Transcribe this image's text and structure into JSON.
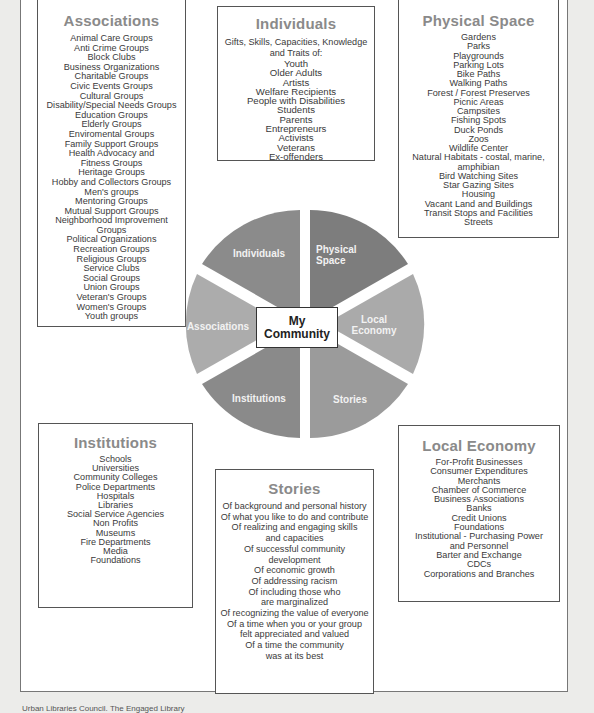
{
  "diagram": {
    "title": "My Community",
    "center_label_line1": "My",
    "center_label_line2": "Community",
    "slices": [
      {
        "id": "individuals",
        "label_line1": "Individuals",
        "label_line2": "",
        "color": "#8b8b8b"
      },
      {
        "id": "physical",
        "label_line1": "Physical",
        "label_line2": "Space",
        "color": "#7d7d7d"
      },
      {
        "id": "economy",
        "label_line1": "Local",
        "label_line2": "Economy",
        "color": "#aaaaaa"
      },
      {
        "id": "stories",
        "label_line1": "Stories",
        "label_line2": "",
        "color": "#9b9b9b"
      },
      {
        "id": "institutions",
        "label_line1": "Institutions",
        "label_line2": "",
        "color": "#8a8a8a"
      },
      {
        "id": "associations",
        "label_line1": "Associations",
        "label_line2": "",
        "color": "#acacac"
      }
    ]
  },
  "associations": {
    "title": "Associations",
    "items": [
      "Animal Care Groups",
      "Anti Crime Groups",
      "Block Clubs",
      "Business Organizations",
      "Charitable Groups",
      "Civic Events Groups",
      "Cultural Groups",
      "Disability/Special Needs Groups",
      "Education Groups",
      "Elderly Groups",
      "Enviromental Groups",
      "Family Support Groups",
      "Health Advocacy and",
      "Fitness Groups",
      "Heritage Groups",
      "Hobby and Collectors Groups",
      "Men's groups",
      "Mentoring Groups",
      "Mutual Support Groups",
      "Neighborhood Improvement",
      "Groups",
      "Political Organizations",
      "Recreation Groups",
      "Religious Groups",
      "Service Clubs",
      "Social Groups",
      "Union Groups",
      "Veteran's Groups",
      "Women's Groups",
      "Youth groups"
    ]
  },
  "individuals": {
    "title": "Individuals",
    "intro_line1": "Gifts, Skills, Capacities, Knowledge",
    "intro_line2": "and Traits of:",
    "items": [
      "Youth",
      "Older Adults",
      "Artists",
      "Welfare Recipients",
      "People with Disabilities",
      "Students",
      "Parents",
      "Entrepreneurs",
      "Activists",
      "Veterans",
      "Ex-offenders"
    ]
  },
  "physical_space": {
    "title": "Physical Space",
    "items": [
      "Gardens",
      "Parks",
      "Playgrounds",
      "Parking Lots",
      "Bike Paths",
      "Walking Paths",
      "Forest / Forest Preserves",
      "Picnic Areas",
      "Campsites",
      "Fishing Spots",
      "Duck Ponds",
      "Zoos",
      "Wildlife Center",
      "Natural Habitats - costal, marine,",
      "amphibian",
      "Bird Watching Sites",
      "Star Gazing Sites",
      "Housing",
      "Vacant Land and Buildings",
      "Transit Stops and Facilities",
      "Streets"
    ]
  },
  "institutions": {
    "title": "Institutions",
    "items": [
      "Schools",
      "Universities",
      "Community Colleges",
      "Police Departments",
      "Hospitals",
      "Libraries",
      "Social Service Agencies",
      "Non Profits",
      "Museums",
      "Fire Departments",
      "Media",
      "Foundations"
    ]
  },
  "stories": {
    "title": "Stories",
    "items": [
      "Of background and personal history",
      "Of what you like to do and contribute",
      "Of realizing and engaging skills",
      "and capacities",
      "Of successful community",
      "development",
      "Of economic growth",
      "Of addressing racism",
      "Of including those who",
      "are marginalized",
      "Of recognizing the value of everyone",
      "Of a time when you or your group",
      "felt appreciated and valued",
      "Of a time the community",
      "was at its best"
    ]
  },
  "local_economy": {
    "title": "Local Economy",
    "items": [
      "For-Profit Businesses",
      "Consumer Expenditures",
      "Merchants",
      "Chamber of Commerce",
      "Business Associations",
      "Banks",
      "Credit Unions",
      "Foundations",
      "Institutional - Purchasing Power",
      "and Personnel",
      "Barter and Exchange",
      "CDCs",
      "Corporations and Branches"
    ]
  },
  "caption": "Urban Libraries Council. The Engaged Library"
}
